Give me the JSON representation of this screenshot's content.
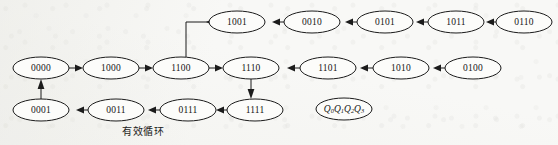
{
  "diagram": {
    "type": "state-transition-diagram",
    "title_caption": "有效循环",
    "caption_position": {
      "x": 143,
      "y": 130
    },
    "legend_node": {
      "id": "legend",
      "text": "Q0Q1Q2Q3",
      "base": "Q",
      "subscripts": [
        "0",
        "1",
        "2",
        "3"
      ],
      "cx": 344,
      "cy": 109,
      "rx": 28,
      "ry": 11
    },
    "colors": {
      "background": "#f8f8f6",
      "node_fill": "#fcfcfa",
      "stroke": "#1b1b1b",
      "text": "#141414"
    },
    "nodes": [
      {
        "id": "n0000",
        "label": "0000",
        "cx": 41,
        "cy": 68,
        "rx": 28,
        "ry": 11
      },
      {
        "id": "n1000",
        "label": "1000",
        "cx": 111,
        "cy": 68,
        "rx": 28,
        "ry": 11
      },
      {
        "id": "n1100",
        "label": "1100",
        "cx": 181,
        "cy": 68,
        "rx": 28,
        "ry": 11
      },
      {
        "id": "n1110",
        "label": "1110",
        "cx": 251,
        "cy": 68,
        "rx": 28,
        "ry": 11
      },
      {
        "id": "n1101",
        "label": "1101",
        "cx": 328,
        "cy": 68,
        "rx": 28,
        "ry": 11
      },
      {
        "id": "n1010",
        "label": "1010",
        "cx": 401,
        "cy": 68,
        "rx": 28,
        "ry": 11
      },
      {
        "id": "n0100",
        "label": "0100",
        "cx": 473,
        "cy": 68,
        "rx": 28,
        "ry": 11
      },
      {
        "id": "n1001",
        "label": "1001",
        "cx": 237,
        "cy": 22,
        "rx": 28,
        "ry": 11
      },
      {
        "id": "n0010",
        "label": "0010",
        "cx": 312,
        "cy": 22,
        "rx": 28,
        "ry": 11
      },
      {
        "id": "n0101",
        "label": "0101",
        "cx": 385,
        "cy": 22,
        "rx": 28,
        "ry": 11
      },
      {
        "id": "n1011",
        "label": "1011",
        "cx": 456,
        "cy": 22,
        "rx": 28,
        "ry": 11
      },
      {
        "id": "n0110",
        "label": "0110",
        "cx": 524,
        "cy": 22,
        "rx": 28,
        "ry": 11
      },
      {
        "id": "n0001",
        "label": "0001",
        "cx": 41,
        "cy": 110,
        "rx": 28,
        "ry": 11
      },
      {
        "id": "n0011",
        "label": "0011",
        "cx": 116,
        "cy": 110,
        "rx": 28,
        "ry": 11
      },
      {
        "id": "n0111",
        "label": "0111",
        "cx": 188,
        "cy": 110,
        "rx": 28,
        "ry": 11
      },
      {
        "id": "n1111",
        "label": "1111",
        "cx": 255,
        "cy": 110,
        "rx": 28,
        "ry": 11
      }
    ],
    "edges": [
      {
        "from": "n0000",
        "to": "n1000",
        "kind": "horizontal",
        "direction": "right"
      },
      {
        "from": "n1000",
        "to": "n1100",
        "kind": "horizontal",
        "direction": "right"
      },
      {
        "from": "n1100",
        "to": "n1110",
        "kind": "horizontal",
        "direction": "right"
      },
      {
        "from": "n1110",
        "to": "n1111",
        "kind": "vertical",
        "direction": "down"
      },
      {
        "from": "n1111",
        "to": "n0111",
        "kind": "horizontal",
        "direction": "left"
      },
      {
        "from": "n0111",
        "to": "n0011",
        "kind": "horizontal",
        "direction": "left"
      },
      {
        "from": "n0011",
        "to": "n0001",
        "kind": "horizontal",
        "direction": "left"
      },
      {
        "from": "n0001",
        "to": "n0000",
        "kind": "vertical",
        "direction": "up"
      },
      {
        "from": "n1101",
        "to": "n1110",
        "kind": "horizontal",
        "direction": "left"
      },
      {
        "from": "n1010",
        "to": "n1101",
        "kind": "horizontal",
        "direction": "left"
      },
      {
        "from": "n0100",
        "to": "n1010",
        "kind": "horizontal",
        "direction": "left"
      },
      {
        "from": "n0010",
        "to": "n1001",
        "kind": "horizontal",
        "direction": "left"
      },
      {
        "from": "n0101",
        "to": "n0010",
        "kind": "horizontal",
        "direction": "left"
      },
      {
        "from": "n1011",
        "to": "n0101",
        "kind": "horizontal",
        "direction": "left"
      },
      {
        "from": "n0110",
        "to": "n1011",
        "kind": "horizontal",
        "direction": "left"
      },
      {
        "from": "n1001",
        "to": "n1100",
        "kind": "elbow",
        "direction": "left-down"
      }
    ]
  }
}
